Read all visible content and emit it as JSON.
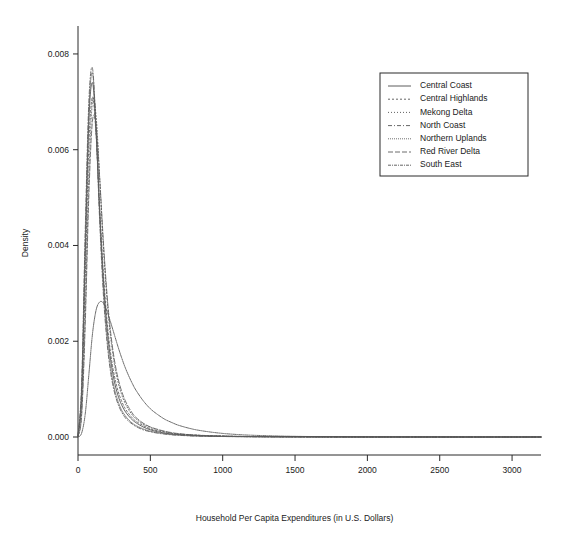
{
  "chart_data": {
    "type": "line",
    "title": "",
    "subtitle": "",
    "xlabel": "Household Per Capita Expenditures (in U.S. Dollars)",
    "ylabel": "Density",
    "xlim": [
      0,
      3200
    ],
    "ylim": [
      0,
      0.0085
    ],
    "grid": false,
    "legend_position": "top-right",
    "xticks": [
      0,
      500,
      1000,
      1500,
      2000,
      2500,
      3000
    ],
    "xticklabels": [
      "0",
      "500",
      "1000",
      "1500",
      "2000",
      "2500",
      "3000"
    ],
    "yticks": [
      0.0,
      0.002,
      0.004,
      0.006,
      0.008
    ],
    "yticklabels": [
      "0.000",
      "0.002",
      "0.004",
      "0.006",
      "0.008"
    ],
    "x": [
      0,
      25,
      50,
      75,
      100,
      125,
      150,
      175,
      200,
      225,
      250,
      275,
      300,
      325,
      350,
      375,
      400,
      450,
      500,
      550,
      600,
      650,
      700,
      800,
      900,
      1000,
      1100,
      1200,
      1400,
      1600,
      1800,
      2000,
      2400,
      2800,
      3200
    ],
    "series": [
      {
        "name": "Central Coast",
        "dash": "none",
        "color": "#4a4a4a",
        "values": [
          2e-05,
          0.0009,
          0.0038,
          0.0066,
          0.0074,
          0.0064,
          0.0047,
          0.0033,
          0.0023,
          0.00163,
          0.00118,
          0.00088,
          0.00068,
          0.00054,
          0.00044,
          0.00036,
          0.0003,
          0.00021,
          0.00015,
          0.00011,
          8e-05,
          6e-05,
          5e-05,
          3e-05,
          2e-05,
          1.5e-05,
          1e-05,
          8e-06,
          5e-06,
          3e-06,
          2e-06,
          1e-06,
          5e-07,
          2e-07,
          1e-07
        ]
      },
      {
        "name": "Central Highlands",
        "dash": "2,2",
        "color": "#555555",
        "values": [
          2e-05,
          0.00075,
          0.0033,
          0.0061,
          0.0071,
          0.0063,
          0.0048,
          0.00345,
          0.00245,
          0.00176,
          0.0013,
          0.00098,
          0.00076,
          0.0006,
          0.00049,
          0.0004,
          0.00033,
          0.00024,
          0.00017,
          0.00013,
          0.0001,
          7e-05,
          6e-05,
          4e-05,
          3e-05,
          2e-05,
          1.4e-05,
          1e-05,
          6e-06,
          4e-06,
          2e-06,
          1e-06,
          5e-07,
          2e-07,
          1e-07
        ]
      },
      {
        "name": "Mekong Delta",
        "dash": "1,2",
        "color": "#4f4f4f",
        "values": [
          1e-05,
          0.0005,
          0.0026,
          0.00545,
          0.007,
          0.0067,
          0.0054,
          0.004,
          0.0029,
          0.0021,
          0.00155,
          0.00117,
          0.0009,
          0.00071,
          0.00057,
          0.00046,
          0.00038,
          0.00027,
          0.0002,
          0.00015,
          0.00011,
          8e-05,
          6e-05,
          4e-05,
          2.5e-05,
          1.7e-05,
          1.2e-05,
          8e-06,
          5e-06,
          3e-06,
          2e-06,
          1e-06,
          5e-07,
          2e-07,
          1e-07
        ]
      },
      {
        "name": "North Coast",
        "dash": "4,2,1,2",
        "color": "#565656",
        "values": [
          3e-05,
          0.0011,
          0.0043,
          0.007,
          0.0077,
          0.0064,
          0.0045,
          0.003,
          0.002,
          0.00136,
          0.00096,
          0.0007,
          0.00053,
          0.00041,
          0.00033,
          0.00027,
          0.00022,
          0.00015,
          0.00011,
          8e-05,
          6e-05,
          4.5e-05,
          3.5e-05,
          2e-05,
          1.4e-05,
          1e-05,
          7e-06,
          5e-06,
          3e-06,
          2e-06,
          1e-06,
          8e-07,
          4e-07,
          2e-07,
          1e-07
        ]
      },
      {
        "name": "Northern Uplands",
        "dash": "1,1",
        "color": "#606060",
        "values": [
          3e-05,
          0.001,
          0.0041,
          0.0068,
          0.0076,
          0.00645,
          0.00465,
          0.00315,
          0.00212,
          0.00146,
          0.00103,
          0.00076,
          0.00057,
          0.00045,
          0.00036,
          0.00029,
          0.00024,
          0.00017,
          0.00012,
          9e-05,
          7e-05,
          5e-05,
          4e-05,
          2.3e-05,
          1.6e-05,
          1.1e-05,
          8e-06,
          6e-06,
          3e-06,
          2e-06,
          1e-06,
          8e-07,
          4e-07,
          2e-07,
          1e-07
        ]
      },
      {
        "name": "Red River Delta",
        "dash": "5,2",
        "color": "#5b5b5b",
        "values": [
          1e-05,
          0.00045,
          0.00235,
          0.00505,
          0.0066,
          0.0065,
          0.0054,
          0.0041,
          0.003,
          0.0022,
          0.00164,
          0.00125,
          0.00097,
          0.00077,
          0.00062,
          0.0005,
          0.00041,
          0.00029,
          0.00021,
          0.00016,
          0.00012,
          9e-05,
          7e-05,
          4.2e-05,
          2.7e-05,
          1.8e-05,
          1.3e-05,
          9e-06,
          5e-06,
          3e-06,
          2e-06,
          1e-06,
          5e-07,
          2e-07,
          1e-07
        ]
      },
      {
        "name": "South East",
        "dash": "3,1,1,1",
        "color": "#525252",
        "values": [
          0.0,
          8e-05,
          0.00048,
          0.0013,
          0.00215,
          0.00265,
          0.00282,
          0.0028,
          0.00263,
          0.0024,
          0.00215,
          0.0019,
          0.00167,
          0.00146,
          0.00128,
          0.00112,
          0.00098,
          0.00076,
          0.00059,
          0.00047,
          0.00037,
          0.0003,
          0.00024,
          0.00016,
          0.00011,
          7.5e-05,
          5.2e-05,
          3.7e-05,
          1.9e-05,
          1e-05,
          6e-06,
          3e-06,
          1.2e-06,
          5e-07,
          2e-07
        ]
      }
    ]
  }
}
